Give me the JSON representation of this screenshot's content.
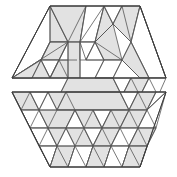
{
  "figure": {
    "background_color": "#ffffff",
    "fill_gray": "#e2e2e2",
    "fill_white": "#ffffff",
    "edge_color": "#555555",
    "outline_color": "#3a3a3a",
    "canvas": {
      "width": 177,
      "height": 177
    },
    "halves": [
      {
        "name": "upper-half",
        "label": "upper trapezoid",
        "outline": "50,6 140,6 166,78 12,78"
      },
      {
        "name": "lower-half",
        "label": "lower trapezoid",
        "outline": "12,92 166,92 140,167 50,167"
      }
    ],
    "upper_pieces": [
      {
        "name": "u01",
        "shade": "white",
        "points": "12,78 50,6 68,42"
      },
      {
        "name": "u02",
        "shade": "gray",
        "points": "50,6 68,42 50,42"
      },
      {
        "name": "u03",
        "shade": "gray",
        "points": "50,6 86,6 80,42 68,42"
      },
      {
        "name": "u04",
        "shade": "white",
        "points": "86,6 104,6 95,42 80,42"
      },
      {
        "name": "u05",
        "shade": "gray",
        "points": "104,6 113,24 95,42"
      },
      {
        "name": "u06",
        "shade": "white",
        "points": "104,6 122,6 113,24"
      },
      {
        "name": "u07",
        "shade": "gray",
        "points": "122,6 140,6 131,42 113,24"
      },
      {
        "name": "u08",
        "shade": "white",
        "points": "140,6 166,78 149,78 131,42"
      },
      {
        "name": "u09",
        "shade": "white",
        "points": "12,78 68,42 50,42 32,78"
      },
      {
        "name": "u10",
        "shade": "gray",
        "points": "50,42 68,42 59,60 41,60"
      },
      {
        "name": "u11",
        "shade": "white",
        "points": "41,60 59,60 50,78"
      },
      {
        "name": "u12",
        "shade": "gray",
        "points": "59,60 77,60 68,78 50,78"
      },
      {
        "name": "u13",
        "shade": "gray",
        "points": "68,42 80,42 80,78 68,78"
      },
      {
        "name": "u14",
        "shade": "white",
        "points": "80,42 95,42 86,60 80,60"
      },
      {
        "name": "u15",
        "shade": "white",
        "points": "86,60 95,42 104,60"
      },
      {
        "name": "u16",
        "shade": "gray",
        "points": "95,42 113,24 122,60 104,60"
      },
      {
        "name": "u17",
        "shade": "white",
        "points": "104,60 122,60 113,78 95,78"
      },
      {
        "name": "u18",
        "shade": "gray",
        "points": "122,60 131,42 149,78 140,78"
      },
      {
        "name": "u19",
        "shade": "gray",
        "points": "12,78 32,78 50,78 41,60"
      },
      {
        "name": "u20",
        "shade": "gray",
        "points": "68,78 113,78 122,96 59,96"
      },
      {
        "name": "u21",
        "shade": "white",
        "points": "113,78 131,78 122,96"
      },
      {
        "name": "u22",
        "shade": "gray",
        "points": "131,78 149,78 140,96 122,96"
      },
      {
        "name": "u23",
        "shade": "white",
        "points": "149,78 166,78 158,96 140,96"
      }
    ],
    "lower_pieces": [
      {
        "name": "l01",
        "shade": "gray",
        "points": "12,92 30,92 39,110 21,110"
      },
      {
        "name": "l02",
        "shade": "white",
        "points": "30,92 48,92 39,110"
      },
      {
        "name": "l03",
        "shade": "gray",
        "points": "48,92 66,92 75,110 57,110"
      },
      {
        "name": "l04",
        "shade": "gray",
        "points": "66,92 120,92 129,110 57,110"
      },
      {
        "name": "l05",
        "shade": "white",
        "points": "120,92 138,92 129,110"
      },
      {
        "name": "l06",
        "shade": "gray",
        "points": "138,92 156,92 147,110 129,110"
      },
      {
        "name": "l07",
        "shade": "white",
        "points": "156,92 166,92 147,110"
      },
      {
        "name": "l08",
        "shade": "white",
        "points": "21,110 39,110 48,128 30,128"
      },
      {
        "name": "l09",
        "shade": "gray",
        "points": "39,110 57,110 75,110 66,128 48,128"
      },
      {
        "name": "l10",
        "shade": "white",
        "points": "66,128 75,110 84,128"
      },
      {
        "name": "l11",
        "shade": "gray",
        "points": "75,110 93,110 102,128 84,128"
      },
      {
        "name": "l12",
        "shade": "white",
        "points": "93,110 111,110 102,128"
      },
      {
        "name": "l13",
        "shade": "gray",
        "points": "111,110 129,110 120,128 102,128"
      },
      {
        "name": "l14",
        "shade": "gray",
        "points": "129,110 147,110 138,128 120,128"
      },
      {
        "name": "l15",
        "shade": "white",
        "points": "147,110 166,92 156,128 138,128"
      },
      {
        "name": "l16",
        "shade": "white",
        "points": "30,128 48,128 57,146 39,146"
      },
      {
        "name": "l17",
        "shade": "gray",
        "points": "48,128 66,128 57,146"
      },
      {
        "name": "l18",
        "shade": "gray",
        "points": "66,128 84,128 93,146 75,146"
      },
      {
        "name": "l19",
        "shade": "white",
        "points": "84,128 102,128 93,146"
      },
      {
        "name": "l20",
        "shade": "gray",
        "points": "102,128 120,128 111,146 93,146"
      },
      {
        "name": "l21",
        "shade": "white",
        "points": "120,128 138,128 129,146 111,146"
      },
      {
        "name": "l22",
        "shade": "gray",
        "points": "138,128 156,128 147,146 129,146"
      },
      {
        "name": "l23",
        "shade": "white",
        "points": "39,146 57,146 50,167"
      },
      {
        "name": "l24",
        "shade": "gray",
        "points": "57,146 75,146 68,167 50,167"
      },
      {
        "name": "l25",
        "shade": "white",
        "points": "75,146 93,146 86,167 68,167"
      },
      {
        "name": "l26",
        "shade": "gray",
        "points": "93,146 111,146 104,167 86,167"
      },
      {
        "name": "l27",
        "shade": "white",
        "points": "111,146 129,146 122,167 104,167"
      },
      {
        "name": "l28",
        "shade": "gray",
        "points": "129,146 147,146 140,167 122,167"
      }
    ],
    "upper_lattice": [
      "12,78 50,6",
      "50,6 140,6",
      "140,6 166,78",
      "12,78 166,78",
      "50,6 68,42",
      "86,6 68,42",
      "86,6 80,42",
      "104,6 80,42",
      "104,6 95,42",
      "104,6 113,24",
      "122,6 113,24",
      "122,6 131,42",
      "140,6 131,42",
      "113,24 131,42",
      "113,24 95,42",
      "50,42 68,42",
      "68,42 80,42",
      "80,42 95,42",
      "95,42 113,24",
      "50,6 50,42",
      "50,42 41,60",
      "41,60 59,60",
      "59,60 77,60",
      "68,42 59,60",
      "68,42 50,78",
      "50,42 32,78",
      "41,60 50,78",
      "59,60 50,78",
      "59,60 68,78",
      "68,42 68,78",
      "80,42 80,78",
      "80,42 86,60",
      "86,60 95,42",
      "95,42 104,60",
      "86,60 104,60",
      "95,42 122,60",
      "104,60 122,60",
      "122,60 131,42",
      "104,60 95,78",
      "122,60 113,78",
      "113,78 95,78",
      "122,60 140,78",
      "131,42 149,78",
      "12,78 68,42",
      "32,78 41,60",
      "68,78 59,96",
      "113,78 122,96",
      "131,78 122,96",
      "131,78 140,96",
      "149,78 140,96",
      "149,78 158,96",
      "59,96 158,96",
      "140,6 166,78"
    ],
    "lower_lattice": [
      "12,92 166,92",
      "12,92 50,167",
      "166,92 140,167",
      "50,167 140,167",
      "12,92 21,110",
      "30,92 21,110",
      "30,92 39,110",
      "48,92 39,110",
      "48,92 57,110",
      "66,92 57,110",
      "66,92 75,110",
      "120,92 129,110",
      "138,92 129,110",
      "138,92 147,110",
      "156,92 147,110",
      "166,92 147,110",
      "21,110 39,110",
      "39,110 57,110",
      "57,110 75,110",
      "75,110 93,110",
      "93,110 111,110",
      "111,110 129,110",
      "129,110 147,110",
      "147,110 156,128",
      "21,110 30,128",
      "39,110 30,128",
      "39,110 48,128",
      "57,110 48,128",
      "75,110 66,128",
      "75,110 84,128",
      "93,110 84,128",
      "93,110 102,128",
      "111,110 102,128",
      "111,110 120,128",
      "129,110 120,128",
      "129,110 138,128",
      "147,110 138,128",
      "30,128 48,128",
      "48,128 66,128",
      "66,128 84,128",
      "84,128 102,128",
      "102,128 120,128",
      "120,128 138,128",
      "138,128 156,128",
      "30,128 39,146",
      "48,128 39,146",
      "48,128 57,146",
      "66,128 57,146",
      "66,128 75,146",
      "84,128 75,146",
      "84,128 93,146",
      "102,128 93,146",
      "102,128 111,146",
      "120,128 111,146",
      "120,128 129,146",
      "138,128 129,146",
      "138,128 147,146",
      "156,128 147,146",
      "39,146 57,146",
      "57,146 75,146",
      "75,146 93,146",
      "93,146 111,146",
      "111,146 129,146",
      "129,146 147,146",
      "39,146 50,167",
      "57,146 50,167",
      "57,146 68,167",
      "75,146 68,167",
      "75,146 86,167",
      "93,146 86,167",
      "93,146 104,167",
      "111,146 104,167",
      "111,146 122,167",
      "129,146 122,167",
      "129,146 140,167",
      "147,146 140,167",
      "66,92 120,92",
      "57,110 129,110"
    ]
  }
}
